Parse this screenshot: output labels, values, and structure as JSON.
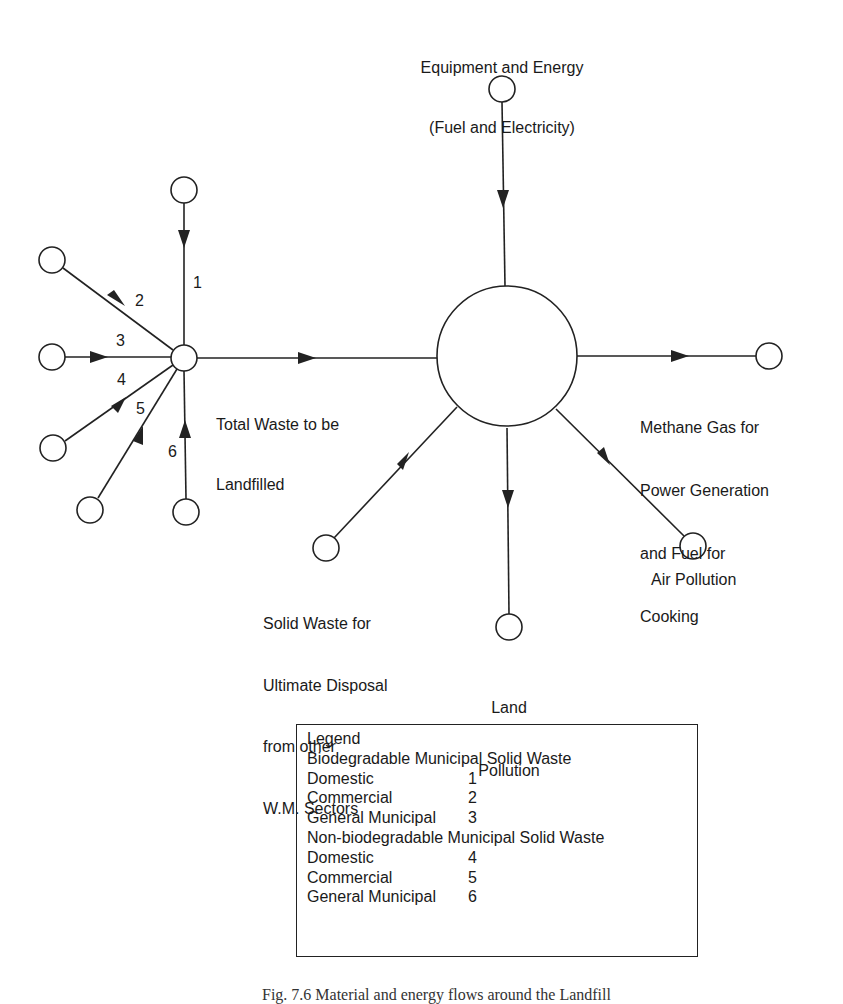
{
  "diagram": {
    "title_partial": "Fig. 7.6 Material and energy flows around the Landfill",
    "nodes": {
      "energy_input": {
        "label_line1": "Equipment and Energy",
        "label_line2": "(Fuel and Electricity)"
      },
      "hub": {
        "label_line1": "Total Waste to be",
        "label_line2": "Landfilled"
      },
      "landfill": {
        "label": ""
      },
      "methane": {
        "label_line1": "Methane Gas for",
        "label_line2": "Power Generation",
        "label_line3": "and Fuel for",
        "label_line4": "Cooking"
      },
      "air_pollution": {
        "label": "Air Pollution"
      },
      "land_pollution": {
        "label_line1": "Land",
        "label_line2": "Pollution"
      },
      "solid_waste": {
        "label_line1": "Solid Waste for",
        "label_line2": "Ultimate Disposal",
        "label_line3": "from other",
        "label_line4": "W.M. Sectors"
      }
    },
    "input_streams": [
      {
        "id": "1",
        "label": "1"
      },
      {
        "id": "2",
        "label": "2"
      },
      {
        "id": "3",
        "label": "3"
      },
      {
        "id": "4",
        "label": "4"
      },
      {
        "id": "5",
        "label": "5"
      },
      {
        "id": "6",
        "label": "6"
      }
    ]
  },
  "legend": {
    "title": "Legend",
    "groups": [
      {
        "heading": "Biodegradable Municipal Solid Waste",
        "items": [
          {
            "name": "Domestic",
            "code": "1"
          },
          {
            "name": "Commercial",
            "code": "2"
          },
          {
            "name": "General Municipal",
            "code": "3"
          }
        ]
      },
      {
        "heading": "Non-biodegradable Municipal Solid Waste",
        "items": [
          {
            "name": "Domestic",
            "code": "4"
          },
          {
            "name": "Commercial",
            "code": "5"
          },
          {
            "name": "General Municipal",
            "code": "6"
          }
        ]
      }
    ]
  },
  "colors": {
    "stroke": "#222222",
    "background": "#ffffff",
    "text": "#1a1a1a"
  }
}
